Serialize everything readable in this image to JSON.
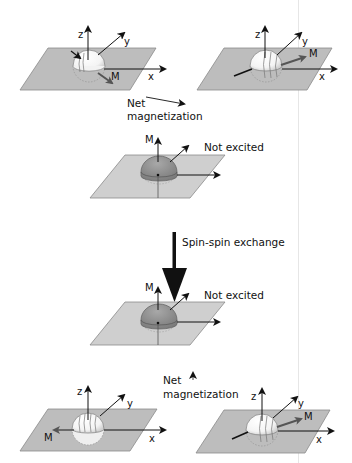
{
  "diagram": {
    "type": "spin-spin exchange (T2 relaxation) schematic",
    "colors": {
      "plane": "#bdbdbd",
      "plane_edge": "#8a8a8a",
      "sphere": "#ffffff",
      "dome_unexcited": "#8c8c8c",
      "arrow": "#111111",
      "text": "#111111"
    },
    "axis_labels": {
      "x": "x",
      "y": "y",
      "z": "z",
      "m": "M"
    },
    "top_row": {
      "left_panel": {
        "caption": "excited spin, M in -y/x direction"
      },
      "right_panel": {
        "caption": "excited spin, M along +x/y"
      }
    },
    "net_magnetization_top": {
      "line1": "Net",
      "line2": "magnetization",
      "arrow": "long arrow (large net)"
    },
    "not_excited_top": {
      "label": "Not excited",
      "m_label": "M"
    },
    "transition": {
      "label": "Spin-spin exchange",
      "arrow": "big downward arrow"
    },
    "not_excited_bottom": {
      "label": "Not excited",
      "m_label": "M"
    },
    "net_magnetization_bottom": {
      "line1": "Net",
      "line2": "magnetization",
      "arrow": "tiny arrow (small net)"
    },
    "bottom_row": {
      "left_panel": {
        "caption": "dephased spin, M along -x"
      },
      "right_panel": {
        "caption": "dephased spin, M along +x/y"
      }
    }
  }
}
